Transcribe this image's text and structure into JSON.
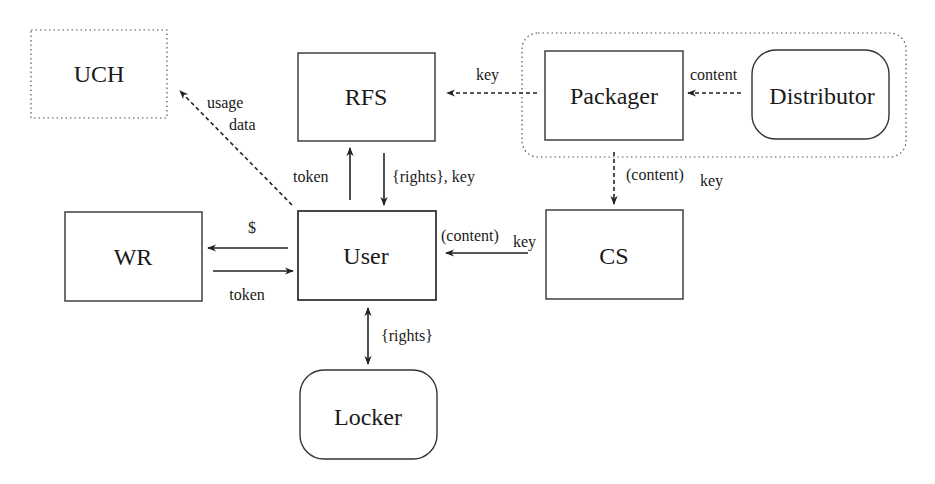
{
  "diagram": {
    "nodes": {
      "uch": {
        "label": "UCH",
        "shape": "dotted-rect"
      },
      "rfs": {
        "label": "RFS",
        "shape": "rect"
      },
      "packager": {
        "label": "Packager",
        "shape": "rect"
      },
      "distributor": {
        "label": "Distributor",
        "shape": "rounded-rect"
      },
      "wr": {
        "label": "WR",
        "shape": "rect"
      },
      "user": {
        "label": "User",
        "shape": "rect"
      },
      "cs": {
        "label": "CS",
        "shape": "rect"
      },
      "locker": {
        "label": "Locker",
        "shape": "rounded-rect"
      }
    },
    "groups": [
      {
        "name": "packager-distributor-group",
        "members": [
          "packager",
          "distributor"
        ],
        "style": "dotted-rounded"
      }
    ],
    "edges": {
      "user_to_uch": {
        "from": "user",
        "to": "uch",
        "label_line1": "usage",
        "label_line2": "data",
        "style": "dashed"
      },
      "packager_to_rfs": {
        "from": "packager",
        "to": "rfs",
        "label": "key",
        "style": "dashed"
      },
      "distributor_to_packager": {
        "from": "distributor",
        "to": "packager",
        "label": "content",
        "style": "dashed"
      },
      "user_to_rfs": {
        "from": "user",
        "to": "rfs",
        "label": "token",
        "style": "solid"
      },
      "rfs_to_user": {
        "from": "rfs",
        "to": "user",
        "label": "{rights}, key",
        "style": "solid"
      },
      "packager_to_cs": {
        "from": "packager",
        "to": "cs",
        "label_main": "(content)",
        "label_sub": "key",
        "style": "dashed"
      },
      "user_to_wr": {
        "from": "user",
        "to": "wr",
        "label": "$",
        "style": "solid"
      },
      "wr_to_user": {
        "from": "wr",
        "to": "user",
        "label": "token",
        "style": "solid"
      },
      "cs_to_user": {
        "from": "cs",
        "to": "user",
        "label_main": "(content)",
        "label_sub": "key",
        "style": "solid"
      },
      "user_locker": {
        "from": "user",
        "to": "locker",
        "label": "{rights}",
        "style": "solid-bidirectional"
      }
    }
  }
}
